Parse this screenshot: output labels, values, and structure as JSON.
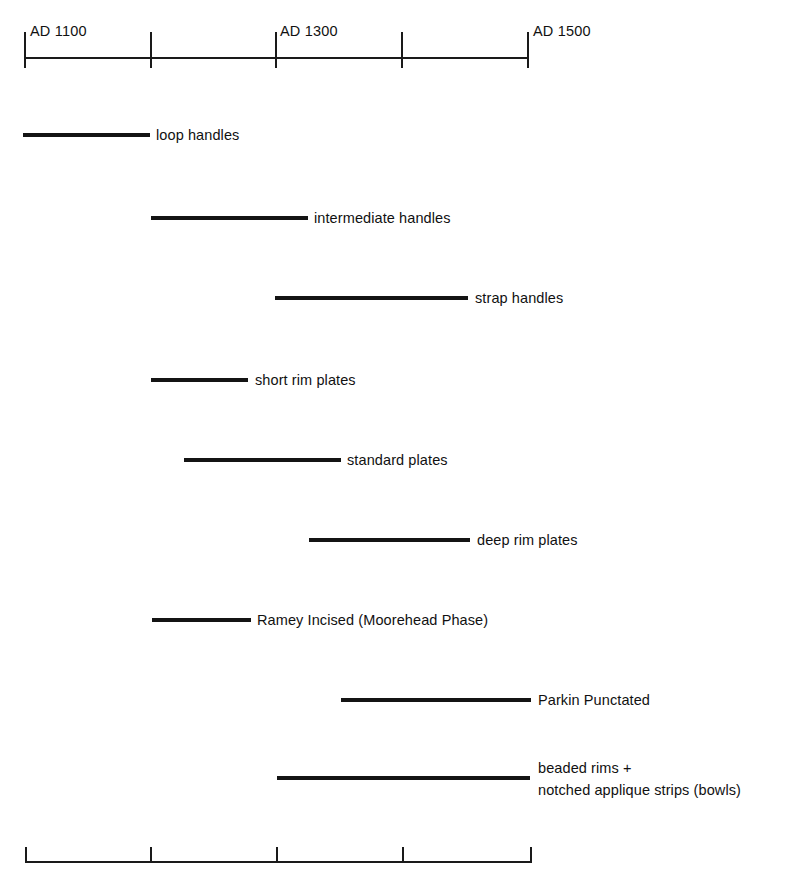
{
  "chart_data": {
    "type": "bar",
    "title": "",
    "subtitle": "",
    "xlabel": "",
    "ylabel": "",
    "orientation": "horizontal",
    "grid": false,
    "legend": "none",
    "xlim": [
      1050,
      1500
    ],
    "x_axis": {
      "unit": "year AD",
      "tick_values": [
        1100,
        1200,
        1300,
        1400,
        1500
      ],
      "tick_labels": [
        "AD 1100",
        "",
        "AD 1300",
        "",
        "AD 1500"
      ],
      "labeled_ticks": [
        {
          "value": 1100,
          "label": "AD 1100"
        },
        {
          "value": 1300,
          "label": "AD 1300"
        },
        {
          "value": 1500,
          "label": "AD 1500"
        }
      ],
      "top_axis_shown": true,
      "bottom_axis_shown": true,
      "bottom_axis_labeled": false
    },
    "categories": [
      "loop handles",
      "intermediate handles",
      "strap handles",
      "short rim plates",
      "standard plates",
      "deep rim plates",
      "Ramey Incised (Moorehead Phase)",
      "Parkin Punctated",
      "beaded rims +\nnotched applique strips (bowls)"
    ],
    "ranges": [
      {
        "label": "loop handles",
        "start": 1100,
        "end": 1200
      },
      {
        "label": "intermediate handles",
        "start": 1200,
        "end": 1325
      },
      {
        "label": "strap handles",
        "start": 1300,
        "end": 1453
      },
      {
        "label": "short rim plates",
        "start": 1200,
        "end": 1278
      },
      {
        "label": "standard plates",
        "start": 1226,
        "end": 1351
      },
      {
        "label": "deep rim plates",
        "start": 1326,
        "end": 1455
      },
      {
        "label": "Ramey Incised (Moorehead Phase)",
        "start": 1200,
        "end": 1280
      },
      {
        "label": "Parkin Punctated",
        "start": 1352,
        "end": 1503
      },
      {
        "label": "beaded rims +\nnotched applique strips (bowls)",
        "start": 1301,
        "end": 1502
      }
    ]
  },
  "axis": {
    "top": {
      "name": "top-time-axis",
      "labels": [
        {
          "text": "AD 1100",
          "x": 30,
          "y": 24
        },
        {
          "text": "AD 1300",
          "x": 280,
          "y": 24
        },
        {
          "text": "AD 1500",
          "x": 533,
          "y": 24
        }
      ],
      "ticks_x": [
        24,
        150,
        275,
        401,
        527
      ],
      "line": {
        "x": 24,
        "y": 57,
        "width": 504
      },
      "tick_top": 32,
      "tick_height": 36
    },
    "bottom": {
      "name": "bottom-time-axis",
      "ticks_x": [
        25,
        150,
        276,
        402,
        530
      ],
      "line": {
        "x": 25,
        "y": 861,
        "width": 506
      },
      "tick_top": 847,
      "tick_height": 16
    }
  },
  "rows": [
    {
      "name": "loop-handles",
      "label": "loop handles",
      "bar": {
        "x": 23,
        "y": 133,
        "width": 127
      },
      "label_x": 156,
      "label_y": 126,
      "lines": 1
    },
    {
      "name": "intermediate-handles",
      "label": "intermediate handles",
      "bar": {
        "x": 151,
        "y": 216,
        "width": 157
      },
      "label_x": 314,
      "label_y": 209,
      "lines": 1
    },
    {
      "name": "strap-handles",
      "label": "strap handles",
      "bar": {
        "x": 275,
        "y": 296,
        "width": 193
      },
      "label_x": 475,
      "label_y": 289,
      "lines": 1
    },
    {
      "name": "short-rim-plates",
      "label": "short rim plates",
      "bar": {
        "x": 151,
        "y": 378,
        "width": 97
      },
      "label_x": 255,
      "label_y": 371,
      "lines": 1
    },
    {
      "name": "standard-plates",
      "label": "standard plates",
      "bar": {
        "x": 184,
        "y": 458,
        "width": 157
      },
      "label_x": 347,
      "label_y": 451,
      "lines": 1
    },
    {
      "name": "deep-rim-plates",
      "label": "deep rim plates",
      "bar": {
        "x": 309,
        "y": 538,
        "width": 161
      },
      "label_x": 477,
      "label_y": 531,
      "lines": 1
    },
    {
      "name": "ramey-incised-moorehead-phase",
      "label": "Ramey Incised (Moorehead Phase)",
      "bar": {
        "x": 152,
        "y": 618,
        "width": 99
      },
      "label_x": 257,
      "label_y": 611,
      "lines": 1
    },
    {
      "name": "parkin-punctated",
      "label": "Parkin Punctated",
      "bar": {
        "x": 341,
        "y": 698,
        "width": 190
      },
      "label_x": 538,
      "label_y": 691,
      "lines": 1
    },
    {
      "name": "beaded-rims-notched-applique-strips-bowls",
      "label": "beaded rims +\nnotched applique strips (bowls)",
      "bar": {
        "x": 277,
        "y": 776,
        "width": 253
      },
      "label_x": 538,
      "label_y": 757,
      "lines": 2
    }
  ],
  "style": {
    "ink_color": "#141414",
    "background_color": "#ffffff"
  }
}
